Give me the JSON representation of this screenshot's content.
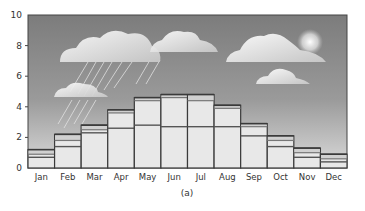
{
  "chart_data": {
    "type": "bar",
    "subtype": "stacked-bar",
    "title": "",
    "caption": "(a)",
    "xlabel": "",
    "ylabel": "",
    "ylim": [
      0,
      10
    ],
    "yticks": [
      0,
      2,
      4,
      6,
      8,
      10
    ],
    "grid": false,
    "legend": null,
    "background": "sky gradient with clouds, rain and sun illustration",
    "categories": [
      "Jan",
      "Feb",
      "Mar",
      "Apr",
      "May",
      "Jun",
      "Jul",
      "Aug",
      "Sep",
      "Oct",
      "Nov",
      "Dec"
    ],
    "series": [
      {
        "name": "level 1",
        "values": [
          0.7,
          1.4,
          2.3,
          2.6,
          2.8,
          2.7,
          2.7,
          2.7,
          2.1,
          1.4,
          0.7,
          0.4
        ]
      },
      {
        "name": "level 2",
        "values": [
          0.9,
          1.8,
          2.5,
          3.6,
          4.4,
          4.6,
          4.4,
          3.9,
          2.7,
          1.8,
          1.0,
          0.6
        ]
      },
      {
        "name": "level 3 (top)",
        "values": [
          1.2,
          2.2,
          2.8,
          3.8,
          4.6,
          4.8,
          4.8,
          4.1,
          2.9,
          2.1,
          1.3,
          0.9
        ]
      }
    ]
  },
  "colors": {
    "sky_top": "#7a7a7a",
    "sky_bottom": "#d8d8d8",
    "bar_fill": "#e8e8e8",
    "bar_edge": "#3a3a3a",
    "inner_line": "#555555",
    "cloud": "#f4f4f4"
  }
}
